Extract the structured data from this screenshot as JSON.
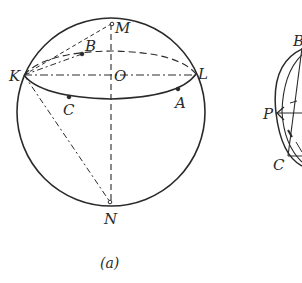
{
  "figure_a": {
    "caption": "(a)",
    "points": {
      "M": "M",
      "B": "B",
      "O": "O",
      "K": "K",
      "L": "L",
      "C": "C",
      "A": "A",
      "N": "N"
    }
  },
  "figure_b": {
    "points": {
      "B": "B",
      "P": "P",
      "C": "C"
    }
  },
  "colors": {
    "ink": "#2a2a2a",
    "background": "#ffffff"
  }
}
